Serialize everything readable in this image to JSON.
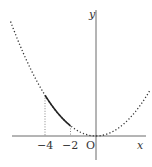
{
  "chart_data": {
    "type": "line",
    "title": "",
    "function": "y = a x^2 (a > 0)",
    "xlabel": "x",
    "ylabel": "y",
    "origin_label": "O",
    "x_ticks": [
      {
        "value": -4,
        "label": "−4"
      },
      {
        "value": -2,
        "label": "−2"
      }
    ],
    "series": [
      {
        "name": "parabola (dotted)",
        "style": "dotted",
        "x": [
          -6.7,
          4.2
        ]
      },
      {
        "name": "highlighted segment (solid)",
        "style": "solid",
        "x": [
          -4,
          -2
        ]
      }
    ],
    "guides": [
      {
        "x": -4,
        "style": "dotted vertical"
      },
      {
        "x": -2,
        "style": "dotted vertical"
      }
    ],
    "grid": false
  },
  "labels": {
    "x_axis": "x",
    "y_axis": "y",
    "origin": "O",
    "tick_m4": "−4",
    "tick_m2": "−2"
  }
}
